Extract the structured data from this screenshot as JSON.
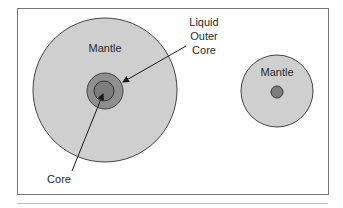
{
  "figure": {
    "large_body": {
      "mantle_label": "Mantle",
      "outer_core_label": [
        "Liquid",
        "Outer",
        "Core"
      ],
      "core_label": "Core"
    },
    "small_body": {
      "mantle_label": "Mantle"
    }
  },
  "colors": {
    "mantle_fill": "#cfcfcf",
    "outer_core_fill": "#8f8f8f",
    "core_fill": "#7d7d7d",
    "outline": "#444444",
    "frame": "#777777",
    "separator": "#bdbdbd"
  }
}
